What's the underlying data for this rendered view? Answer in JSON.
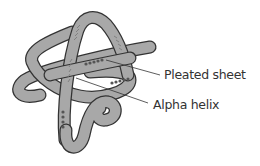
{
  "diagram": {
    "labels": [
      {
        "text": "Pleated sheet"
      },
      {
        "text": "Alpha helix"
      }
    ],
    "colors": {
      "ribbon_fill": "#a8a8a8",
      "ribbon_stroke": "#333333",
      "sheet_marks": "#555555",
      "helix_marks": "#777777",
      "leader_line": "#333333",
      "text": "#333333"
    }
  }
}
